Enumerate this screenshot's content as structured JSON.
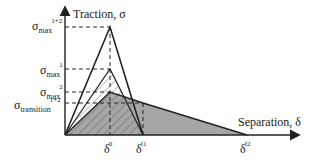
{
  "axes": {
    "y_label": "Traction, σ",
    "x_label": "Separation, δ"
  },
  "y_ticks": [
    {
      "sym": "σ",
      "sub": "max",
      "sup": "1+2"
    },
    {
      "sym": "σ",
      "sub": "max",
      "sup": "1"
    },
    {
      "sym": "σ",
      "sub": "max",
      "sup": "2"
    },
    {
      "sym": "σ",
      "sub": "transition",
      "sup": "1+2"
    }
  ],
  "x_ticks": [
    {
      "sym": "δ",
      "sup": "0"
    },
    {
      "sym": "δ",
      "sup": "f1"
    },
    {
      "sym": "δ",
      "sup": "f2"
    }
  ],
  "colors": {
    "line": "#222222",
    "fill_gray": "#a6a6a6",
    "hatch": "#444444"
  }
}
